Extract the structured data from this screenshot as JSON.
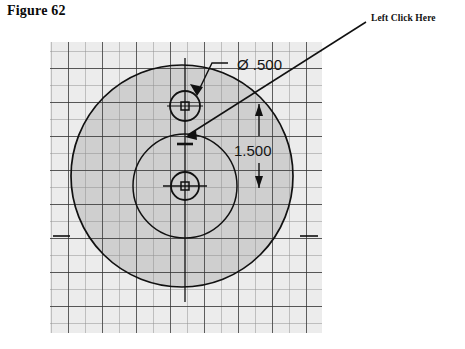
{
  "figure": {
    "title": "Figure 62"
  },
  "annotation": {
    "callout_label": "Left Click Here",
    "leader_from": {
      "x": 366,
      "y": 22
    },
    "leader_to": {
      "x": 184,
      "y": 134
    }
  },
  "canvas": {
    "background_color": "#ffffff",
    "panel_fill": "#d0d0d0",
    "panel_outside_fill": "#eeeeee",
    "grid_minor_color": "#8a8a8a",
    "grid_major_color": "#2a2a2a",
    "geometry_color": "#111111",
    "panel": {
      "x": 50,
      "y": 42,
      "width": 272,
      "height": 291
    },
    "grid": {
      "minor_step": 17,
      "major_every": 2
    }
  },
  "drawing": {
    "type": "cad-sketch",
    "outer_circle": {
      "cx": 182,
      "cy": 176,
      "r": 111,
      "label": "outer-profile-circle"
    },
    "inner_circle": {
      "cx": 185,
      "cy": 186,
      "r": 52,
      "label": "inner-profile-circle"
    },
    "top_hole": {
      "cx": 185,
      "cy": 106,
      "r": 15,
      "label": "top-hole"
    },
    "bottom_hole": {
      "cx": 185,
      "cy": 186,
      "r": 14,
      "label": "bottom-hole"
    },
    "center_axis": {
      "x": 185,
      "y1": 60,
      "y2": 300
    }
  },
  "dimensions": [
    {
      "name": "diameter-dimension",
      "text": "Ø .500",
      "text_x": 237,
      "text_y": 69,
      "leader_points": "226,62 212,62 196,95",
      "arrow_at": {
        "x": 196,
        "y": 95
      }
    },
    {
      "name": "linear-dimension",
      "text": "1.500",
      "text_x": 237,
      "text_y": 155,
      "extension_x": 259,
      "y_top": 106,
      "y_bottom": 186
    }
  ],
  "colors": {
    "panel_fill": "#d0d0d0",
    "grid_major": "#2a2a2a",
    "grid_minor": "#8a8a8a",
    "ink": "#111111",
    "title_text": "#0a0a0a"
  }
}
